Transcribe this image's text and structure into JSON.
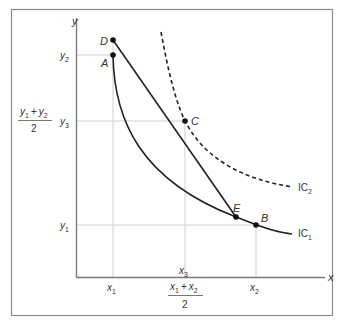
{
  "diagram": {
    "type": "indifference-curves",
    "axes": {
      "x_label": "x",
      "y_label": "y"
    },
    "y_ticks": [
      {
        "id": "y2",
        "base": "y",
        "sub": "2"
      },
      {
        "id": "y3",
        "base": "y",
        "sub": "3"
      },
      {
        "id": "y1",
        "base": "y",
        "sub": "1"
      }
    ],
    "x_ticks": [
      {
        "id": "x1",
        "base": "x",
        "sub": "1"
      },
      {
        "id": "x3",
        "base": "x",
        "sub": "3"
      },
      {
        "id": "x2",
        "base": "x",
        "sub": "2"
      }
    ],
    "y_fraction": {
      "num_a": "y",
      "num_a_sub": "1",
      "plus": "+",
      "num_b": "y",
      "num_b_sub": "2",
      "den": "2"
    },
    "x_fraction": {
      "num_a": "x",
      "num_a_sub": "1",
      "plus": "+",
      "num_b": "x",
      "num_b_sub": "2",
      "den": "2"
    },
    "points": [
      {
        "label": "D"
      },
      {
        "label": "A"
      },
      {
        "label": "C"
      },
      {
        "label": "E"
      },
      {
        "label": "B"
      }
    ],
    "curves": [
      {
        "name": "IC",
        "sub": "1",
        "style": "solid"
      },
      {
        "name": "IC",
        "sub": "2",
        "style": "dashed"
      }
    ],
    "colors": {
      "frame": "#8a8a8a",
      "axis": "#7a7a7a",
      "grid": "#cfcfcf",
      "curve": "#222222",
      "text": "#333333"
    }
  }
}
